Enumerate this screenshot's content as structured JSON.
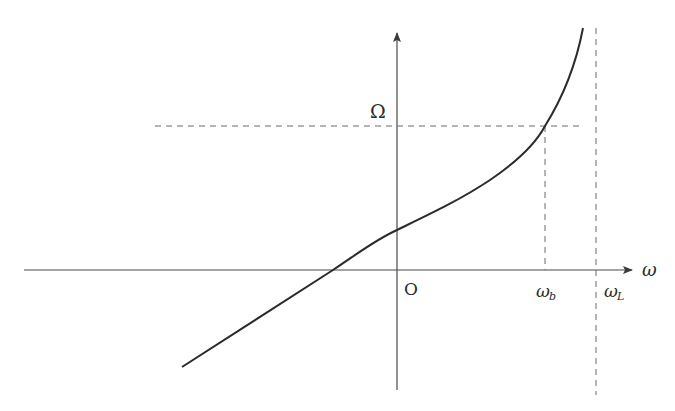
{
  "diagram": {
    "type": "dispersion-curve",
    "colors": {
      "axis": "#4a4a4a",
      "curve": "#2b2b2b",
      "dashed": "#6a6a6a",
      "background": "#ffffff"
    },
    "labels": {
      "y_axis": "Ω",
      "x_axis": "ω",
      "origin": "O",
      "omega_b": "ω",
      "omega_b_sub": "b",
      "omega_L": "ω",
      "omega_L_sub": "L"
    },
    "annotations": {
      "horizontal_dashed": "Ω level",
      "vertical_dashed_b": "ω_b marker",
      "vertical_dashed_L": "ω_L asymptote"
    }
  }
}
